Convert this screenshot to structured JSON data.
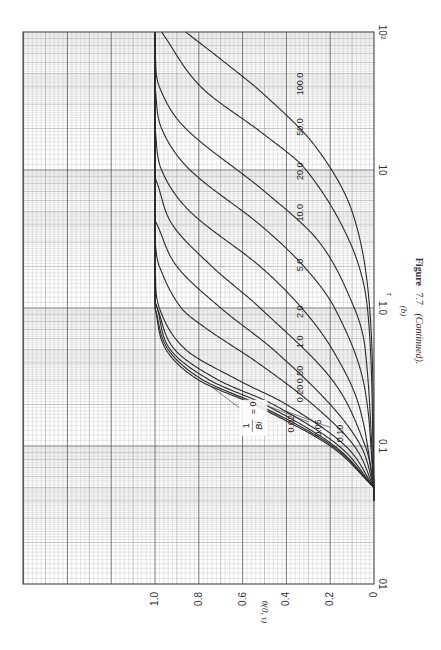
{
  "figure": {
    "caption_prefix": "Figure",
    "caption_number": "7.7",
    "caption_suffix": "(Continued).",
    "panel_label": "(b)"
  },
  "axes": {
    "x_title": "τ",
    "y_title": "θ(0, τ)",
    "x_ticks": [
      {
        "value": 0.01,
        "label": "01"
      },
      {
        "value": 0.1,
        "label": "0.1"
      },
      {
        "value": 1.0,
        "label": "1.0"
      },
      {
        "value": 10,
        "label": "10"
      },
      {
        "value": 100,
        "label": "10²"
      }
    ],
    "y_ticks": [
      {
        "value": 0,
        "label": "0"
      },
      {
        "value": 0.2,
        "label": "0.2"
      },
      {
        "value": 0.4,
        "label": "0.4"
      },
      {
        "value": 0.6,
        "label": "0.6"
      },
      {
        "value": 0.8,
        "label": "0.8"
      },
      {
        "value": 1.0,
        "label": "1.0"
      }
    ]
  },
  "legend": {
    "param_label_num": "1",
    "param_label_den": "Bi",
    "param_label_eq": "= 0"
  },
  "chart_data": {
    "type": "line",
    "xlabel": "τ",
    "ylabel": "θ(0, τ)",
    "xscale": "log",
    "xlim": [
      0.01,
      100
    ],
    "ylim": [
      0,
      1.0
    ],
    "grid": true,
    "orientation": "rotated 90° counterclockwise on page",
    "parameter": "1/Bi",
    "series": [
      {
        "name": "1/Bi = 0",
        "label": "0",
        "tau_half": 0.19,
        "points": [
          [
            0.05,
            0.0
          ],
          [
            0.1,
            0.2
          ],
          [
            0.2,
            0.55
          ],
          [
            0.3,
            0.8
          ],
          [
            0.5,
            0.95
          ],
          [
            1.0,
            1.0
          ]
        ]
      },
      {
        "name": "1/Bi = 0.02",
        "label": "0.02",
        "tau_half": 0.195,
        "points": [
          [
            0.05,
            0.0
          ],
          [
            0.1,
            0.19
          ],
          [
            0.2,
            0.53
          ],
          [
            0.3,
            0.78
          ],
          [
            0.5,
            0.94
          ],
          [
            1.0,
            1.0
          ]
        ]
      },
      {
        "name": "1/Bi = 0.05",
        "label": "0.05",
        "tau_half": 0.205,
        "points": [
          [
            0.05,
            0.0
          ],
          [
            0.1,
            0.18
          ],
          [
            0.2,
            0.5
          ],
          [
            0.3,
            0.75
          ],
          [
            0.5,
            0.93
          ],
          [
            1.0,
            0.99
          ]
        ]
      },
      {
        "name": "1/Bi = 0.10",
        "label": "0.10",
        "tau_half": 0.22,
        "points": [
          [
            0.05,
            0.0
          ],
          [
            0.1,
            0.16
          ],
          [
            0.2,
            0.46
          ],
          [
            0.3,
            0.71
          ],
          [
            0.5,
            0.91
          ],
          [
            1.0,
            0.99
          ]
        ]
      },
      {
        "name": "1/Bi = 0.20",
        "label": "0.20",
        "tau_half": 0.26,
        "points": [
          [
            0.05,
            0.0
          ],
          [
            0.1,
            0.13
          ],
          [
            0.2,
            0.4
          ],
          [
            0.3,
            0.62
          ],
          [
            0.5,
            0.86
          ],
          [
            1.0,
            0.98
          ],
          [
            2.0,
            1.0
          ]
        ]
      },
      {
        "name": "1/Bi = 0.50",
        "label": "0.50",
        "tau_half": 0.37,
        "points": [
          [
            0.05,
            0.0
          ],
          [
            0.1,
            0.09
          ],
          [
            0.2,
            0.28
          ],
          [
            0.4,
            0.53
          ],
          [
            0.7,
            0.76
          ],
          [
            1.0,
            0.88
          ],
          [
            2.0,
            0.98
          ],
          [
            3.0,
            1.0
          ]
        ]
      },
      {
        "name": "1/Bi = 1.0",
        "label": "1.0",
        "tau_half": 0.55,
        "points": [
          [
            0.05,
            0.0
          ],
          [
            0.1,
            0.06
          ],
          [
            0.2,
            0.2
          ],
          [
            0.5,
            0.46
          ],
          [
            1.0,
            0.7
          ],
          [
            2.0,
            0.9
          ],
          [
            4.0,
            0.99
          ]
        ]
      },
      {
        "name": "1/Bi = 2.0",
        "label": "2.0",
        "tau_half": 0.95,
        "points": [
          [
            0.05,
            0.0
          ],
          [
            0.1,
            0.04
          ],
          [
            0.3,
            0.19
          ],
          [
            1.0,
            0.52
          ],
          [
            2.0,
            0.74
          ],
          [
            4.0,
            0.92
          ],
          [
            8.0,
            0.99
          ]
        ]
      },
      {
        "name": "1/Bi = 5.0",
        "label": "5.0",
        "tau_half": 2.1,
        "points": [
          [
            0.05,
            0.0
          ],
          [
            0.2,
            0.07
          ],
          [
            0.5,
            0.19
          ],
          [
            1.0,
            0.33
          ],
          [
            2.0,
            0.52
          ],
          [
            5.0,
            0.84
          ],
          [
            10,
            0.97
          ],
          [
            20,
            1.0
          ]
        ]
      },
      {
        "name": "1/Bi = 10.0",
        "label": "10.0",
        "tau_half": 3.9,
        "points": [
          [
            0.05,
            0.0
          ],
          [
            0.3,
            0.05
          ],
          [
            1.0,
            0.18
          ],
          [
            2.0,
            0.32
          ],
          [
            4.0,
            0.52
          ],
          [
            10,
            0.84
          ],
          [
            20,
            0.97
          ],
          [
            40,
            1.0
          ]
        ]
      },
      {
        "name": "1/Bi = 20.0",
        "label": "20.0",
        "tau_half": 7.4,
        "points": [
          [
            0.05,
            0.0
          ],
          [
            0.5,
            0.04
          ],
          [
            1.0,
            0.09
          ],
          [
            3.0,
            0.25
          ],
          [
            7.0,
            0.5
          ],
          [
            20,
            0.86
          ],
          [
            40,
            0.98
          ],
          [
            70,
            1.0
          ]
        ]
      },
      {
        "name": "1/Bi = 50.0",
        "label": "50.0",
        "tau_half": 18,
        "points": [
          [
            0.05,
            0.0
          ],
          [
            1.0,
            0.03
          ],
          [
            3.0,
            0.11
          ],
          [
            10,
            0.31
          ],
          [
            18,
            0.5
          ],
          [
            40,
            0.79
          ],
          [
            100,
            0.97
          ]
        ]
      },
      {
        "name": "1/Bi = 100.0",
        "label": "100.0",
        "tau_half": 35,
        "points": [
          [
            0.05,
            0.0
          ],
          [
            1.0,
            0.02
          ],
          [
            5.0,
            0.1
          ],
          [
            15,
            0.27
          ],
          [
            35,
            0.5
          ],
          [
            60,
            0.68
          ],
          [
            100,
            0.86
          ]
        ]
      }
    ]
  }
}
